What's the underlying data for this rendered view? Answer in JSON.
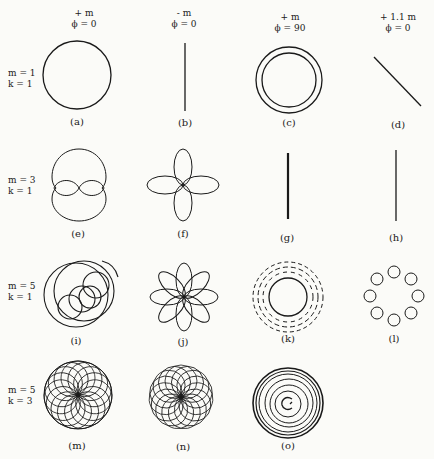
{
  "columns": [
    {
      "line1": "+ m",
      "line2": "ϕ = 0"
    },
    {
      "line1": "- m",
      "line2": "ϕ = 0"
    },
    {
      "line1": "+ m",
      "line2": "ϕ = 90"
    },
    {
      "line1": "+ 1.1 m",
      "line2": "ϕ = 0"
    }
  ],
  "rows": [
    {
      "line1": "m = 1",
      "line2": "k = 1"
    },
    {
      "line1": "m = 3",
      "line2": "k = 1"
    },
    {
      "line1": "m = 5",
      "line2": "k = 1"
    },
    {
      "line1": "m = 5",
      "line2": "k = 3"
    }
  ],
  "captions": {
    "a": "(a)",
    "b": "(b)",
    "c": "(c)",
    "d": "(d)",
    "e": "(e)",
    "f": "(f)",
    "g": "(g)",
    "h": "(h)",
    "i": "(i)",
    "j": "(j)",
    "k": "(k)",
    "l": "(l)",
    "m": "(m)",
    "n": "(n)",
    "o": "(o)"
  },
  "figures": {
    "a": "single-circle",
    "b": "vertical-line",
    "c": "double-concentric-circle",
    "d": "diagonal-line",
    "e": "circle-with-two-inner-lobes",
    "f": "four-petal-rose",
    "g": "thick-vertical-line",
    "h": "thin-vertical-line",
    "i": "overlapping-loop-circles",
    "j": "eight-petal-rose",
    "k": "dashed-concentric-rings",
    "l": "epicycloid-ring-of-loops",
    "m": "dense-rosette-in-circle",
    "n": "dense-rosette",
    "o": "concentric-spiral"
  }
}
